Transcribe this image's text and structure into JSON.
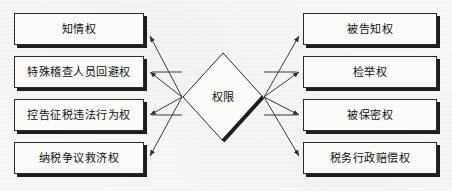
{
  "diagram": {
    "hub": {
      "label": "权限",
      "shape": "diamond",
      "center_x": 223,
      "center_y": 97,
      "half_width": 41,
      "half_height": 45
    },
    "colors": {
      "background": "#f7f7f5",
      "box_fill": "#fbfbfa",
      "border": "#2b2b2b",
      "shadow": "#1d1d1d",
      "text": "#101010",
      "edge": "#3a3a3a"
    },
    "left_nodes": [
      {
        "label": "知情权",
        "x": 14,
        "y": 13,
        "w": 130,
        "h": 32,
        "arrow": "diagonal"
      },
      {
        "label": "特殊稽查人员回避权",
        "x": 14,
        "y": 56,
        "w": 130,
        "h": 32,
        "arrow": "horizontal"
      },
      {
        "label": "控告征税违法行为权",
        "x": 14,
        "y": 99,
        "w": 130,
        "h": 32,
        "arrow": "horizontal"
      },
      {
        "label": "纳税争议救济权",
        "x": 14,
        "y": 142,
        "w": 130,
        "h": 32,
        "arrow": "diagonal"
      }
    ],
    "right_nodes": [
      {
        "label": "被告知权",
        "x": 303,
        "y": 13,
        "w": 134,
        "h": 32,
        "arrow": "diagonal"
      },
      {
        "label": "检举权",
        "x": 303,
        "y": 56,
        "w": 134,
        "h": 32,
        "arrow": "horizontal"
      },
      {
        "label": "被保密权",
        "x": 303,
        "y": 99,
        "w": 134,
        "h": 32,
        "arrow": "horizontal"
      },
      {
        "label": "税务行政赔偿权",
        "x": 303,
        "y": 142,
        "w": 134,
        "h": 32,
        "arrow": "diagonal"
      }
    ],
    "edges": [
      {
        "from": "权限",
        "to": "知情权",
        "direction": "outgoing"
      },
      {
        "from": "权限",
        "to": "特殊稽查人员回避权",
        "direction": "outgoing"
      },
      {
        "from": "权限",
        "to": "控告征税违法行为权",
        "direction": "outgoing"
      },
      {
        "from": "权限",
        "to": "纳税争议救济权",
        "direction": "outgoing"
      },
      {
        "from": "权限",
        "to": "被告知权",
        "direction": "outgoing"
      },
      {
        "from": "权限",
        "to": "检举权",
        "direction": "outgoing"
      },
      {
        "from": "权限",
        "to": "被保密权",
        "direction": "outgoing"
      },
      {
        "from": "权限",
        "to": "税务行政赔偿权",
        "direction": "outgoing"
      }
    ]
  }
}
